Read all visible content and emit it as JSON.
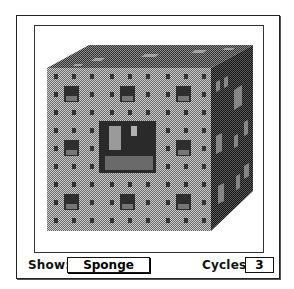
{
  "controls": {
    "show_label": "Show:",
    "show_value": "Sponge",
    "cycles_label": "Cycles:",
    "cycles_value": "3"
  },
  "canvas": {
    "subject": "Menger sponge (3D fractal cube)",
    "iterations": 3,
    "colors": {
      "front_face": "#a8a8a8",
      "top_face": "#6a6a6a",
      "side_face": "#3a3a3a",
      "hole_dark": "#2a2a2a",
      "frame": "#222222"
    }
  }
}
